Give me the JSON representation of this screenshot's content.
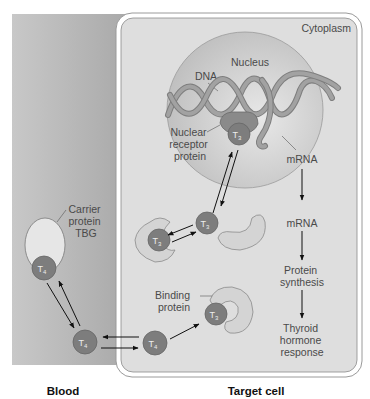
{
  "regions": {
    "blood": "Blood",
    "target_cell": "Target cell",
    "cytoplasm": "Cytoplasm",
    "nucleus": "Nucleus"
  },
  "labels": {
    "dna": "DNA",
    "nuclear_receptor": [
      "Nuclear",
      "receptor",
      "protein"
    ],
    "carrier_protein": [
      "Carrier",
      "protein",
      "TBG"
    ],
    "binding_protein": [
      "Binding",
      "protein"
    ],
    "mrna_nucleus": "mRNA",
    "mrna_cytoplasm": "mRNA",
    "protein_synthesis": [
      "Protein",
      "synthesis"
    ],
    "thyroid_response": [
      "Thyroid",
      "hormone",
      "response"
    ]
  },
  "molecules": {
    "t3": {
      "base": "T",
      "sub": "3"
    },
    "t4": {
      "base": "T",
      "sub": "4"
    }
  },
  "colors": {
    "blood_bg": "#b4b4b4",
    "cell_bg": "#dcdcdc",
    "nucleus": "#c8c8c8",
    "dna": "#8e8e8e",
    "hormone": "#7a7a7a",
    "protein_light": "#d4d4d4"
  }
}
